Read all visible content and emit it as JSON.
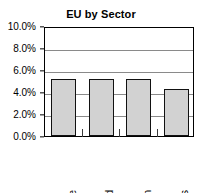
{
  "chart_data": {
    "type": "bar",
    "title": "EU by Sector",
    "xlabel": "",
    "ylabel": "",
    "categories": [
      "Textile",
      "Food",
      "Engin",
      "Stores"
    ],
    "values": [
      5.2,
      5.2,
      5.2,
      4.3
    ],
    "ylim": [
      0,
      10
    ],
    "ytick_values": [
      0.0,
      2.0,
      4.0,
      6.0,
      8.0,
      10.0
    ],
    "ytick_labels": [
      "0.0%",
      "2.0%",
      "4.0%",
      "6.0%",
      "8.0%",
      "10.0%"
    ],
    "value_unit": "%",
    "grid": true,
    "grid_axis": "y",
    "legend": false,
    "legend_position": "none",
    "bar_fill_color": "#d2d2d2",
    "bar_border_color": "#111111",
    "axis_color": "#000000",
    "grid_color": "#8a8a8a",
    "plot_background": "#ffffff",
    "x_label_rotation": -90
  }
}
